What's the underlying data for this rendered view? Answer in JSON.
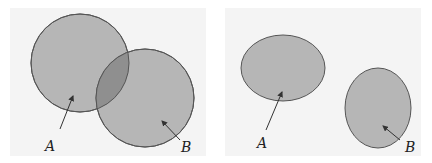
{
  "diagram": {
    "panels": [
      {
        "name": "overlapping-sets",
        "labels": {
          "a": "A",
          "b": "B"
        }
      },
      {
        "name": "disjoint-sets",
        "labels": {
          "a": "A",
          "b": "B"
        }
      }
    ],
    "colors": {
      "panel_bg": "#f4f4f4",
      "set_fill": "#b4b4b4",
      "overlap_fill": "#8f8f8f",
      "stroke": "#555555"
    }
  }
}
